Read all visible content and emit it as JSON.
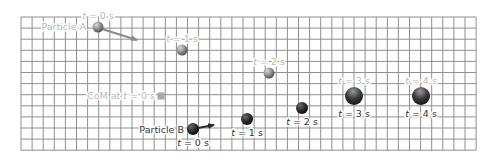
{
  "diagram": {
    "grid": {
      "x0": 21,
      "y0": 17,
      "cols": 41,
      "rows": 12,
      "cell": 11.1,
      "line_color": "#8f8f8f",
      "background": "#ffffff"
    },
    "colors": {
      "particle_a": "#8a8a8a",
      "particle_a_light": "#c8c8c8",
      "particle_b": "#2a2a2a",
      "particle_b_light": "#6a6a6a",
      "com": "#a8a8a8",
      "label_light": "#b8b8b8",
      "label_dark": "#333333",
      "arrow_a": "#8a8a8a",
      "arrow_b": "#2a2a2a"
    },
    "particle_a": {
      "name": "Particle A",
      "label_text": "Particle A",
      "positions": [
        {
          "t": "t = 0 s",
          "var": "t",
          "rest": " = 0 s",
          "cx": 98,
          "cy": 27,
          "r": 5.5
        },
        {
          "t": "t = 1 s",
          "var": "t",
          "rest": " = 1 s",
          "cx": 182,
          "cy": 50,
          "r": 5.5
        },
        {
          "t": "t = 2 s",
          "var": "t",
          "rest": " = 2 s",
          "cx": 269,
          "cy": 73,
          "r": 5.5
        }
      ],
      "velocity_arrow": {
        "x1": 102,
        "y1": 29,
        "x2": 137,
        "y2": 40
      }
    },
    "particle_b": {
      "name": "Particle B",
      "label_text": "Particle B",
      "positions": [
        {
          "t": "t = 0 s",
          "var": "t",
          "rest": " = 0 s",
          "cx": 193,
          "cy": 129,
          "r": 6
        },
        {
          "t": "t = 1 s",
          "var": "t",
          "rest": " = 1 s",
          "cx": 247,
          "cy": 119,
          "r": 6
        },
        {
          "t": "t = 2 s",
          "var": "t",
          "rest": " = 2 s",
          "cx": 302,
          "cy": 108,
          "r": 6
        }
      ],
      "velocity_arrow": {
        "x1": 198,
        "y1": 128,
        "x2": 214,
        "y2": 125
      }
    },
    "merged": {
      "positions": [
        {
          "top_label": "t = 3 s",
          "bottom_label": "t = 3 s",
          "var": "t",
          "rest": " = 3 s",
          "cx": 354,
          "cy": 96,
          "r": 9
        },
        {
          "top_label": "t = 4 s",
          "bottom_label": "t = 4 s",
          "var": "t",
          "rest": " = 4 s",
          "cx": 421,
          "cy": 96,
          "r": 9
        }
      ]
    },
    "center_of_mass": {
      "label_prefix": "CoM at ",
      "var": "t",
      "label_suffix": " = 0 s",
      "label_full": "CoM at t = 0 s",
      "x": 161,
      "y": 96,
      "size": 7
    }
  }
}
